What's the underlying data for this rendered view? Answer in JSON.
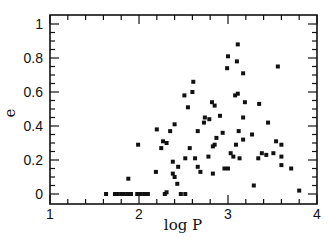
{
  "chart_data": {
    "type": "scatter",
    "title": "",
    "xlabel": "log P",
    "ylabel": "e",
    "xlim": [
      1,
      4
    ],
    "ylim": [
      -0.06,
      1.06
    ],
    "xticks": [
      1,
      2,
      3,
      4
    ],
    "xtick_labels": [
      "1",
      "2",
      "3",
      "4"
    ],
    "yticks": [
      0,
      0.2,
      0.4,
      0.6,
      0.8,
      1
    ],
    "ytick_labels": [
      "0",
      "0.2",
      "0.4",
      "0.6",
      "0.8",
      "1"
    ],
    "grid": false,
    "legend": null,
    "marker": "square",
    "color": "#111111",
    "points": [
      [
        1.63,
        0
      ],
      [
        1.73,
        0
      ],
      [
        1.76,
        0
      ],
      [
        1.8,
        0
      ],
      [
        1.83,
        0
      ],
      [
        1.87,
        0
      ],
      [
        1.88,
        0.09
      ],
      [
        1.91,
        0
      ],
      [
        1.98,
        0
      ],
      [
        1.99,
        0.29
      ],
      [
        2.02,
        0
      ],
      [
        2.06,
        0
      ],
      [
        2.1,
        0
      ],
      [
        2.19,
        0.13
      ],
      [
        2.2,
        0.38
      ],
      [
        2.25,
        0.27
      ],
      [
        2.27,
        0.31
      ],
      [
        2.29,
        0
      ],
      [
        2.31,
        0.01
      ],
      [
        2.31,
        0.3
      ],
      [
        2.35,
        0.37
      ],
      [
        2.38,
        0.19
      ],
      [
        2.38,
        0.12
      ],
      [
        2.4,
        0.41
      ],
      [
        2.4,
        0.1
      ],
      [
        2.43,
        0.06
      ],
      [
        2.44,
        0.16
      ],
      [
        2.47,
        0
      ],
      [
        2.51,
        0.58
      ],
      [
        2.52,
        0
      ],
      [
        2.52,
        0.21
      ],
      [
        2.55,
        0.51
      ],
      [
        2.57,
        0.27
      ],
      [
        2.6,
        0.6
      ],
      [
        2.61,
        0.66
      ],
      [
        2.63,
        0.21
      ],
      [
        2.66,
        0.37
      ],
      [
        2.66,
        0.16
      ],
      [
        2.69,
        0.13
      ],
      [
        2.73,
        0.42
      ],
      [
        2.74,
        0.45
      ],
      [
        2.78,
        0.22
      ],
      [
        2.79,
        0.44
      ],
      [
        2.82,
        0.54
      ],
      [
        2.83,
        0.28
      ],
      [
        2.83,
        0.12
      ],
      [
        2.85,
        0.52
      ],
      [
        2.85,
        0.29
      ],
      [
        2.87,
        0.33
      ],
      [
        2.91,
        0.46
      ],
      [
        2.94,
        0.36
      ],
      [
        2.96,
        0.15
      ],
      [
        2.99,
        0.74
      ],
      [
        3.0,
        0.81
      ],
      [
        3.0,
        0.15
      ],
      [
        3.03,
        0.24
      ],
      [
        3.06,
        0.22
      ],
      [
        3.08,
        0.58
      ],
      [
        3.09,
        0.29
      ],
      [
        3.1,
        0.78
      ],
      [
        3.11,
        0.88
      ],
      [
        3.11,
        0.59
      ],
      [
        3.12,
        0.37
      ],
      [
        3.13,
        0.21
      ],
      [
        3.17,
        0.71
      ],
      [
        3.17,
        0.45
      ],
      [
        3.17,
        0.32
      ],
      [
        3.19,
        0.54
      ],
      [
        3.27,
        0.35
      ],
      [
        3.29,
        0.05
      ],
      [
        3.34,
        0.21
      ],
      [
        3.35,
        0.53
      ],
      [
        3.38,
        0.24
      ],
      [
        3.43,
        0.23
      ],
      [
        3.45,
        0.42
      ],
      [
        3.51,
        0.24
      ],
      [
        3.54,
        0.31
      ],
      [
        3.56,
        0.75
      ],
      [
        3.6,
        0.29
      ],
      [
        3.6,
        0.22
      ],
      [
        3.6,
        0.17
      ],
      [
        3.71,
        0.15
      ],
      [
        3.8,
        0.02
      ]
    ]
  }
}
